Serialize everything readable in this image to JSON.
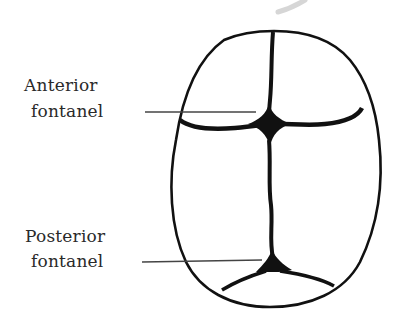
{
  "diagram": {
    "labels": [
      {
        "id": "anterior",
        "line1": "Anterior",
        "line2": "fontanel"
      },
      {
        "id": "posterior",
        "line1": "Posterior",
        "line2": "fontanel"
      }
    ],
    "colors": {
      "ink": "#111111",
      "text": "#2a2a2a",
      "leader": "#444444",
      "watermark": "#d6d6d6",
      "background": "#ffffff"
    }
  }
}
